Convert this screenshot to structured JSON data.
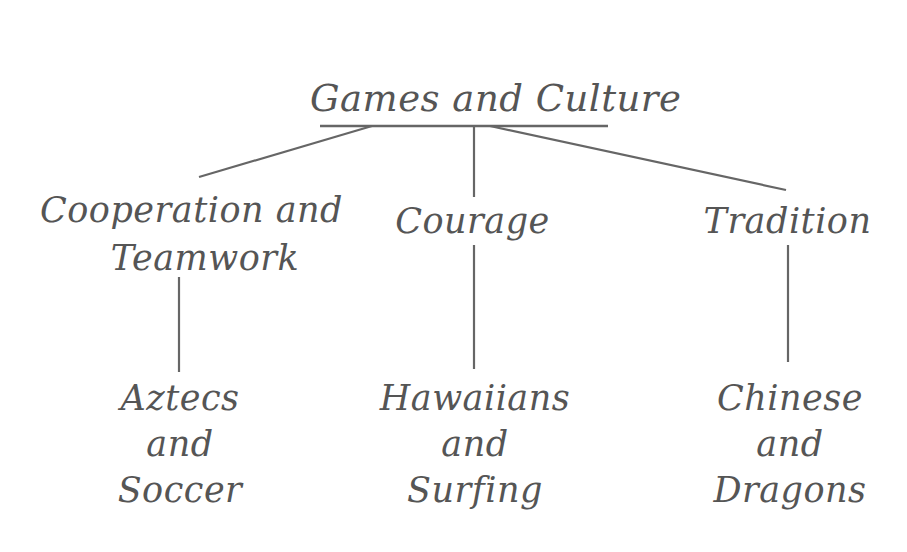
{
  "diagram": {
    "type": "concept-tree",
    "root": {
      "label": "Games and Culture"
    },
    "themes": [
      {
        "label_lines": [
          "Cooperation and",
          "Teamwork"
        ]
      },
      {
        "label_lines": [
          "Courage"
        ]
      },
      {
        "label_lines": [
          "Tradition"
        ]
      }
    ],
    "examples": [
      {
        "label_lines": [
          "Aztecs",
          "and",
          "Soccer"
        ]
      },
      {
        "label_lines": [
          "Hawaiians",
          "and",
          "Surfing"
        ]
      },
      {
        "label_lines": [
          "Chinese",
          "and",
          "Dragons"
        ]
      }
    ],
    "colors": {
      "ink": "#555555",
      "line": "#666666",
      "background": "#ffffff"
    }
  }
}
